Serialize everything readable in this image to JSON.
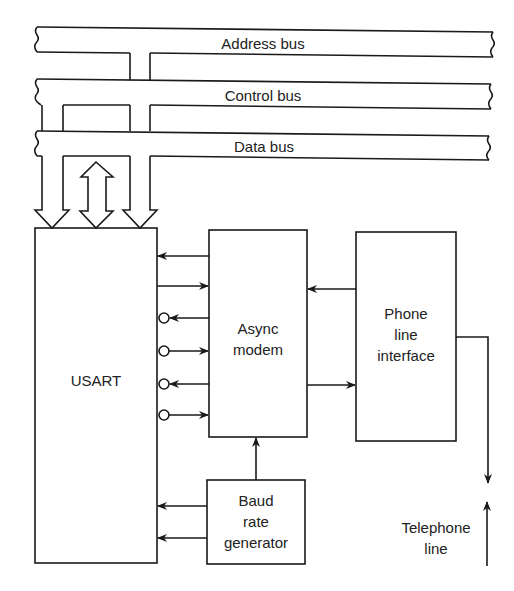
{
  "diagram": {
    "type": "block-diagram",
    "buses": [
      {
        "id": "address",
        "label": "Address bus"
      },
      {
        "id": "control",
        "label": "Control bus"
      },
      {
        "id": "data",
        "label": "Data bus"
      }
    ],
    "blocks": {
      "usart": {
        "label": "USART"
      },
      "async_modem": {
        "line1": "Async",
        "line2": "modem"
      },
      "phone_line_interface": {
        "line1": "Phone",
        "line2": "line",
        "line3": "interface"
      },
      "baud_rate_generator": {
        "line1": "Baud",
        "line2": "rate",
        "line3": "generator"
      }
    },
    "external": {
      "telephone_line": {
        "line1": "Telephone",
        "line2": "line"
      }
    },
    "connections": [
      {
        "from": "control",
        "to": "usart",
        "type": "unidirectional-bus-arrow"
      },
      {
        "from": "data",
        "to": "usart",
        "type": "bidirectional-bus-arrow"
      },
      {
        "from": "address",
        "to": "usart",
        "type": "unidirectional-bus-arrow"
      },
      {
        "from": "async_modem",
        "to": "usart",
        "signal": 1,
        "inverted": false
      },
      {
        "from": "usart",
        "to": "async_modem",
        "signal": 2,
        "inverted": false
      },
      {
        "from": "async_modem",
        "to": "usart",
        "signal": 3,
        "inverted": true
      },
      {
        "from": "usart",
        "to": "async_modem",
        "signal": 4,
        "inverted": true
      },
      {
        "from": "async_modem",
        "to": "usart",
        "signal": 5,
        "inverted": true
      },
      {
        "from": "usart",
        "to": "async_modem",
        "signal": 6,
        "inverted": true
      },
      {
        "from": "phone_line_interface",
        "to": "async_modem"
      },
      {
        "from": "async_modem",
        "to": "phone_line_interface"
      },
      {
        "from": "baud_rate_generator",
        "to": "async_modem"
      },
      {
        "from": "baud_rate_generator",
        "to": "usart",
        "count": 2
      },
      {
        "from": "phone_line_interface",
        "to": "telephone_line",
        "type": "bidirectional"
      }
    ],
    "colors": {
      "line": "#1a1a1a",
      "background": "#ffffff",
      "text": "#222222"
    }
  }
}
